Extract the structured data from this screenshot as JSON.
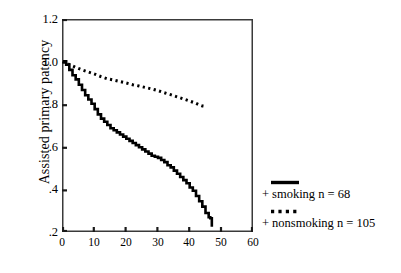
{
  "chart_data": {
    "type": "line",
    "title": "",
    "subtitle": "",
    "xlabel": "",
    "ylabel": "Assisted primary patency",
    "xlim": [
      0,
      60
    ],
    "ylim": [
      0.2,
      1.2
    ],
    "grid": false,
    "legend_position": "right",
    "x_ticks": [
      "0",
      "10",
      "20",
      "30",
      "40",
      "50",
      "60"
    ],
    "x_tick_values": [
      0,
      10,
      20,
      30,
      40,
      50,
      60
    ],
    "y_ticks": [
      "1.2",
      "1.0",
      ".8",
      ".6",
      ".4",
      ".2"
    ],
    "y_tick_values": [
      1.2,
      1.0,
      0.8,
      0.6,
      0.4,
      0.2
    ],
    "series": [
      {
        "name": "smoking n = 68",
        "style": "solid",
        "color": "#000000",
        "marker": "+",
        "n": 68,
        "points": [
          [
            0,
            1.0
          ],
          [
            1,
            0.985
          ],
          [
            2,
            0.96
          ],
          [
            3,
            0.935
          ],
          [
            4,
            0.915
          ],
          [
            5,
            0.89
          ],
          [
            6,
            0.865
          ],
          [
            7,
            0.84
          ],
          [
            8,
            0.82
          ],
          [
            9,
            0.8
          ],
          [
            10,
            0.775
          ],
          [
            11,
            0.75
          ],
          [
            12,
            0.73
          ],
          [
            13,
            0.715
          ],
          [
            14,
            0.7
          ],
          [
            15,
            0.685
          ],
          [
            16,
            0.675
          ],
          [
            17,
            0.665
          ],
          [
            18,
            0.655
          ],
          [
            19,
            0.645
          ],
          [
            20,
            0.635
          ],
          [
            21,
            0.625
          ],
          [
            22,
            0.615
          ],
          [
            23,
            0.605
          ],
          [
            24,
            0.595
          ],
          [
            25,
            0.585
          ],
          [
            26,
            0.575
          ],
          [
            27,
            0.565
          ],
          [
            28,
            0.555
          ],
          [
            29,
            0.55
          ],
          [
            30,
            0.545
          ],
          [
            31,
            0.535
          ],
          [
            32,
            0.525
          ],
          [
            33,
            0.51
          ],
          [
            34,
            0.5
          ],
          [
            35,
            0.485
          ],
          [
            36,
            0.47
          ],
          [
            37,
            0.455
          ],
          [
            38,
            0.44
          ],
          [
            39,
            0.425
          ],
          [
            40,
            0.405
          ],
          [
            41,
            0.39
          ],
          [
            42,
            0.365
          ],
          [
            43,
            0.34
          ],
          [
            44,
            0.315
          ],
          [
            45,
            0.285
          ],
          [
            46,
            0.265
          ],
          [
            46.5,
            0.26
          ],
          [
            47,
            0.22
          ]
        ]
      },
      {
        "name": "nonsmoking n = 105",
        "style": "dotted",
        "color": "#000000",
        "marker": "+",
        "n": 105,
        "points": [
          [
            0,
            1.0
          ],
          [
            2,
            0.985
          ],
          [
            4,
            0.972
          ],
          [
            6,
            0.96
          ],
          [
            8,
            0.95
          ],
          [
            10,
            0.94
          ],
          [
            12,
            0.928
          ],
          [
            14,
            0.918
          ],
          [
            16,
            0.912
          ],
          [
            18,
            0.905
          ],
          [
            20,
            0.898
          ],
          [
            22,
            0.89
          ],
          [
            24,
            0.884
          ],
          [
            26,
            0.877
          ],
          [
            28,
            0.87
          ],
          [
            30,
            0.862
          ],
          [
            32,
            0.852
          ],
          [
            34,
            0.843
          ],
          [
            36,
            0.833
          ],
          [
            38,
            0.823
          ],
          [
            40,
            0.813
          ],
          [
            42,
            0.802
          ],
          [
            43,
            0.795
          ],
          [
            44,
            0.79
          ],
          [
            45,
            0.788
          ]
        ]
      }
    ]
  },
  "legend": {
    "entries": [
      {
        "swatch": "solid-line",
        "plus": "+",
        "label": "smoking n = 68"
      },
      {
        "swatch": "dotted-line",
        "plus": "+",
        "label": "nonsmoking n = 105"
      }
    ]
  },
  "axis": {
    "y_title": "Assisted primary patency"
  }
}
